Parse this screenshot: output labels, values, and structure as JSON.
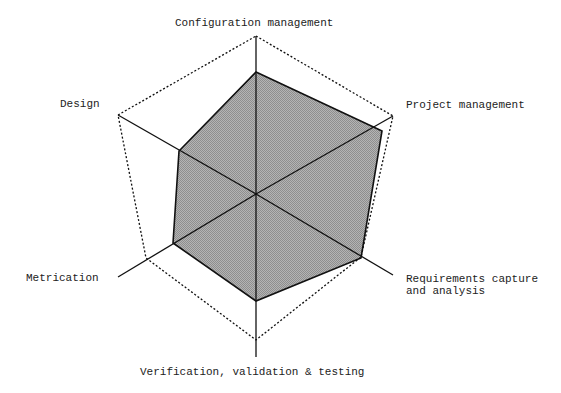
{
  "chart_data": {
    "type": "radar",
    "title": "",
    "categories": [
      "Configuration management",
      "Project management",
      "Requirements capture and analysis",
      "Verification, validation & testing",
      "Metrication",
      "Design"
    ],
    "series": [
      {
        "name": "Assessed level",
        "values": [
          0.77,
          0.92,
          0.99,
          0.74,
          0.67,
          0.56
        ],
        "fill": "#a8a8a8",
        "stroke": "#111111"
      },
      {
        "name": "Target level",
        "values": [
          1.0,
          1.0,
          1.0,
          1.0,
          1.0,
          1.0
        ],
        "style": "dotted",
        "stroke": "#111111"
      }
    ],
    "rlim": [
      0,
      1
    ],
    "grid": false,
    "legend": "none"
  },
  "labels": {
    "config": "Configuration management",
    "project": "Project management",
    "req_line1": "Requirements capture",
    "req_line2": "and analysis",
    "verif": "Verification, validation & testing",
    "metric": "Metrication",
    "design": "Design"
  },
  "geometry": {
    "center": [
      256,
      194
    ],
    "axis_ends": [
      [
        256,
        36
      ],
      [
        393,
        116
      ],
      [
        393,
        275
      ],
      [
        256,
        357
      ],
      [
        118,
        277
      ],
      [
        118,
        115
      ]
    ],
    "outer_polygon": "256,36 393,116 361,257 256,340 146,258 118,115",
    "data_polygon": "256,72 382,131 361,258 256,301 173,243 179,151"
  }
}
